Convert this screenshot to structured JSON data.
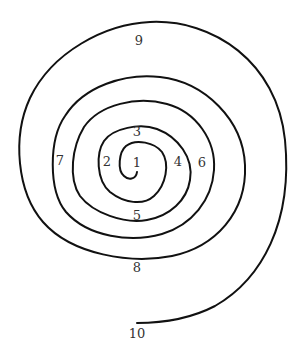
{
  "diagram": {
    "type": "spiral",
    "stroke_color": "#111111",
    "label_color": "#333333",
    "background": "#ffffff",
    "labels": [
      {
        "text": "1",
        "x": 137,
        "y": 162
      },
      {
        "text": "2",
        "x": 107,
        "y": 161
      },
      {
        "text": "3",
        "x": 137,
        "y": 131
      },
      {
        "text": "4",
        "x": 178,
        "y": 161
      },
      {
        "text": "5",
        "x": 137,
        "y": 215
      },
      {
        "text": "6",
        "x": 202,
        "y": 162
      },
      {
        "text": "7",
        "x": 60,
        "y": 160
      },
      {
        "text": "8",
        "x": 137,
        "y": 267
      },
      {
        "text": "9",
        "x": 139,
        "y": 40
      },
      {
        "text": "10",
        "x": 137,
        "y": 333
      }
    ]
  }
}
